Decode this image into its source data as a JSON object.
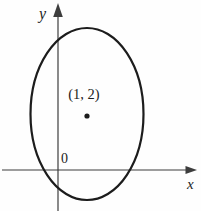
{
  "figure": {
    "labels": {
      "y_axis": "y",
      "x_axis": "x",
      "origin": "0",
      "center_point": "(1, 2)"
    },
    "center_point": {
      "x": 1,
      "y": 2
    },
    "colors": {
      "curve": "#1c1c1c",
      "axis": "#3d3d3d",
      "text": "#1c1c1c",
      "background": "#fefefe"
    }
  }
}
